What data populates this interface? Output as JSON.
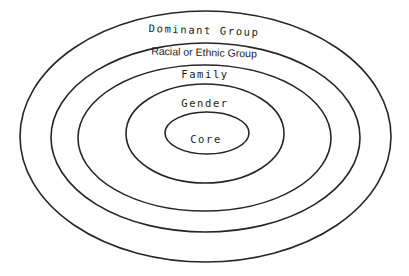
{
  "diagram": {
    "type": "concentric-ellipses",
    "stroke_color": "#262626",
    "background": "#ffffff",
    "layers": [
      {
        "id": "dominant",
        "label": "Dominant Group",
        "cx": 205.5,
        "cy": 136.5,
        "rx": 185.5,
        "ry": 125.5,
        "label_x": 204,
        "label_y": 34,
        "label_style": "mono",
        "label_rotate": 2
      },
      {
        "id": "racial",
        "label": "Racial or Ethnic Group",
        "cx": 205.5,
        "cy": 137.5,
        "rx": 154.5,
        "ry": 94.5,
        "label_x": 204,
        "label_y": 56,
        "label_style": "sans",
        "label_rotate": 1.5
      },
      {
        "id": "family",
        "label": "Family",
        "cx": 204.5,
        "cy": 138,
        "rx": 126.5,
        "ry": 73,
        "label_x": 205,
        "label_y": 78,
        "label_style": "mono",
        "label_rotate": 0
      },
      {
        "id": "gender",
        "label": "Gender",
        "cx": 205,
        "cy": 133.5,
        "rx": 79,
        "ry": 49.5,
        "label_x": 205,
        "label_y": 107,
        "label_style": "mono",
        "label_rotate": 0
      },
      {
        "id": "core",
        "label": "Core",
        "cx": 207,
        "cy": 133,
        "rx": 42,
        "ry": 21,
        "label_x": 206,
        "label_y": 143,
        "label_style": "mono",
        "label_rotate": 0
      }
    ]
  }
}
